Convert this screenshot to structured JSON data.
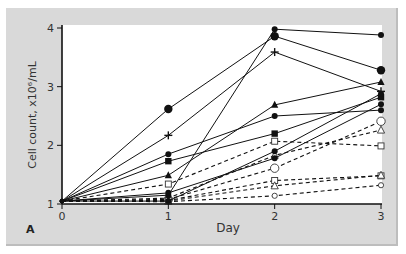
{
  "chart_data": {
    "type": "line",
    "title": "",
    "panel_label": "A",
    "xlabel": "Day",
    "ylabel": "Cell count, x10⁶/mL",
    "x": [
      0,
      1,
      2,
      3
    ],
    "xticks": [
      "0",
      "1",
      "2",
      "3"
    ],
    "yticks": [
      "1",
      "2",
      "3",
      "4"
    ],
    "xlim": [
      0,
      3
    ],
    "ylim": [
      1,
      4
    ],
    "grid": false,
    "legend": "none",
    "series": [
      {
        "name": "solid-large-filled-circle",
        "style": "solid",
        "marker": "large-filled-circle",
        "values": [
          1.05,
          2.62,
          3.86,
          3.28
        ]
      },
      {
        "name": "solid-small-filled-circle-top",
        "style": "solid",
        "marker": "filled-circle",
        "values": [
          1.05,
          1.15,
          3.98,
          3.88
        ]
      },
      {
        "name": "solid-plus",
        "style": "solid",
        "marker": "plus",
        "values": [
          1.05,
          2.17,
          3.59,
          2.92
        ]
      },
      {
        "name": "solid-filled-triangle",
        "style": "solid",
        "marker": "filled-triangle",
        "values": [
          1.05,
          1.49,
          2.69,
          3.08
        ]
      },
      {
        "name": "solid-filled-circle",
        "style": "solid",
        "marker": "filled-circle",
        "values": [
          1.05,
          1.85,
          2.5,
          2.6
        ]
      },
      {
        "name": "solid-filled-square",
        "style": "solid",
        "marker": "filled-square",
        "values": [
          1.05,
          1.73,
          2.2,
          2.82
        ]
      },
      {
        "name": "solid-filled-circle-low",
        "style": "solid",
        "marker": "filled-circle",
        "values": [
          1.05,
          1.19,
          1.78,
          2.7
        ]
      },
      {
        "name": "solid-filled-diamond",
        "style": "solid",
        "marker": "filled-circle",
        "values": [
          1.05,
          1.05,
          1.9,
          2.88
        ]
      },
      {
        "name": "dashed-open-square",
        "style": "dashed",
        "marker": "open-square",
        "values": [
          1.05,
          1.34,
          2.07,
          1.99
        ]
      },
      {
        "name": "dashed-open-triangle-upper",
        "style": "dashed",
        "marker": "open-triangle",
        "values": [
          1.05,
          1.1,
          1.83,
          2.26
        ]
      },
      {
        "name": "dashed-large-open-circle",
        "style": "dashed",
        "marker": "large-open-circle",
        "values": [
          1.05,
          1.08,
          1.61,
          2.41
        ]
      },
      {
        "name": "dashed-open-square-lower",
        "style": "dashed",
        "marker": "open-square",
        "values": [
          1.05,
          1.06,
          1.4,
          1.48
        ]
      },
      {
        "name": "dashed-open-triangle-lower",
        "style": "dashed",
        "marker": "open-triangle",
        "values": [
          1.05,
          1.05,
          1.31,
          1.49
        ]
      },
      {
        "name": "dashed-small-open-circle",
        "style": "dashed",
        "marker": "small-open-circle",
        "values": [
          1.05,
          1.04,
          1.14,
          1.32
        ]
      }
    ]
  }
}
